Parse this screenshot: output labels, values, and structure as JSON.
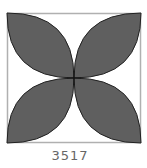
{
  "figure": {
    "label": "3517",
    "shape": "square with four lens-shaped petals",
    "square": {
      "x": 7,
      "y": 13,
      "width": 134,
      "height": 130
    },
    "center": {
      "x": 74,
      "y": 78
    },
    "colors": {
      "petal_fill": "#5f5f5f",
      "petal_stroke": "#222222",
      "border": "#b0b0b0",
      "background": "#ffffff",
      "label": "#666666"
    },
    "petals": [
      {
        "name": "top-left",
        "from": "corner-top-left",
        "to": "center"
      },
      {
        "name": "top-right",
        "from": "corner-top-right",
        "to": "center"
      },
      {
        "name": "bottom-left",
        "from": "corner-bottom-left",
        "to": "center"
      },
      {
        "name": "bottom-right",
        "from": "corner-bottom-right",
        "to": "center"
      }
    ]
  }
}
